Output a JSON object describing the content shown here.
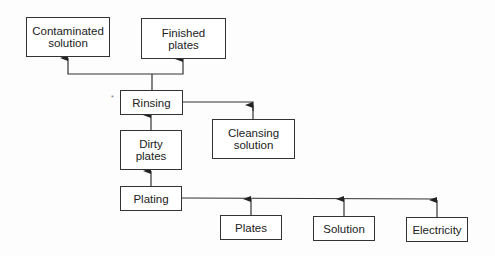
{
  "diagram": {
    "type": "process-flow",
    "nodes": {
      "contaminated_solution": "Contaminated\nsolution",
      "finished_plates": "Finished\nplates",
      "rinsing": "Rinsing",
      "dirty_plates": "Dirty\nplates",
      "cleansing_solution": "Cleansing\nsolution",
      "plating": "Plating",
      "plates": "Plates",
      "solution": "Solution",
      "electricity": "Electricity"
    },
    "edges": [
      {
        "from": "rinsing",
        "to": "contaminated_solution"
      },
      {
        "from": "rinsing",
        "to": "finished_plates"
      },
      {
        "from": "cleansing_solution",
        "to": "rinsing"
      },
      {
        "from": "dirty_plates",
        "to": "rinsing"
      },
      {
        "from": "plating",
        "to": "dirty_plates"
      },
      {
        "from": "plates",
        "to": "plating"
      },
      {
        "from": "solution",
        "to": "plating"
      },
      {
        "from": "electricity",
        "to": "plating"
      }
    ],
    "colors": {
      "line": "#333333",
      "box_fill": "#ffffff"
    }
  }
}
